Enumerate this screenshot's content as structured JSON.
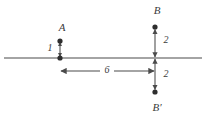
{
  "figure": {
    "background_color": "#ffffff",
    "line_color": "#4a4a4a",
    "dot_color": "#2e2e2e",
    "text_color": "#3b3b3b",
    "width": 207,
    "height": 120
  },
  "points": {
    "a": {
      "label": "A",
      "x": 60,
      "y": 41,
      "label_x": 62,
      "label_y": 28
    },
    "b": {
      "label": "B",
      "x": 155,
      "y": 27,
      "label_x": 157,
      "label_y": 11
    },
    "b_prime": {
      "label": "B′",
      "x": 155,
      "y": 92,
      "label_x": 157,
      "label_y": 108
    }
  },
  "axis": {
    "name": "mirror-line",
    "y": 58,
    "x_start": 4,
    "x_end": 202
  },
  "measurements": {
    "a_to_line": {
      "value": "1",
      "label_x": 50,
      "label_y": 49,
      "orientation": "vertical",
      "from_y": 41,
      "to_y": 58,
      "x": 60
    },
    "b_to_line": {
      "value": "2",
      "label_x": 166,
      "label_y": 41,
      "orientation": "vertical",
      "from_y": 27,
      "to_y": 58,
      "x": 155
    },
    "line_to_b_prime": {
      "value": "2",
      "label_x": 166,
      "label_y": 75,
      "orientation": "vertical",
      "from_y": 58,
      "to_y": 92,
      "x": 155
    },
    "horizontal_span": {
      "value": "6",
      "label_x": 107,
      "label_y": 71,
      "orientation": "horizontal",
      "from_x": 60,
      "to_x": 155,
      "y": 71
    }
  }
}
